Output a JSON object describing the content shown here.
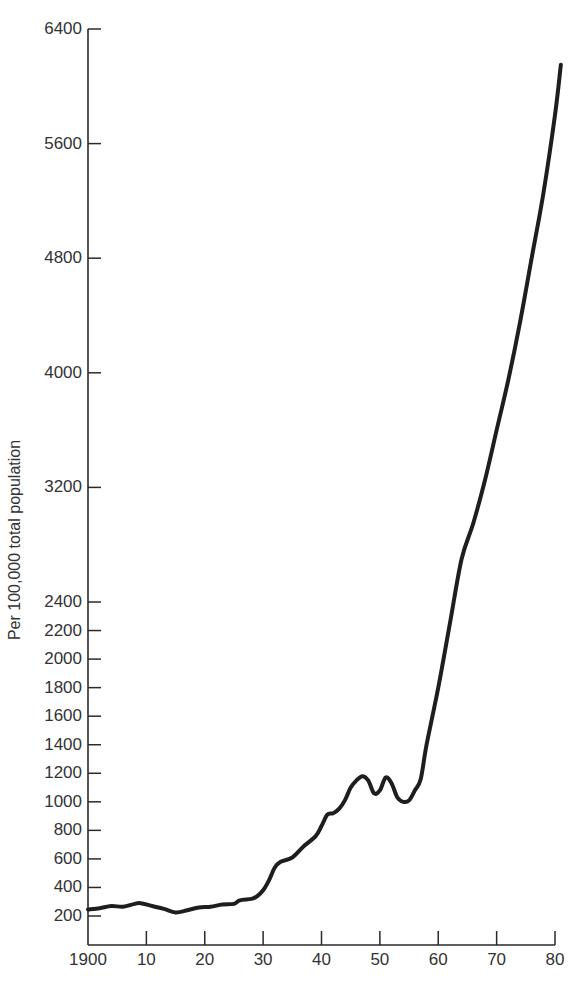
{
  "chart_data": {
    "type": "line",
    "title": "",
    "xlabel": "",
    "ylabel": "Per 100,000 total population",
    "x_ticks": [
      "1900",
      "10",
      "20",
      "30",
      "40",
      "50",
      "60",
      "70",
      "80"
    ],
    "y_ticks": [
      "200",
      "400",
      "600",
      "800",
      "1000",
      "1200",
      "1400",
      "1600",
      "1800",
      "2000",
      "2200",
      "2400",
      "3200",
      "4000",
      "4800",
      "5600",
      "6400"
    ],
    "y_scale_note": "broken scale: 200-step ticks from 200 to 2400, 800-step ticks from 2400 to 6400",
    "xlim": [
      1900,
      1980
    ],
    "ylim": [
      0,
      6400
    ],
    "grid": false,
    "legend": null,
    "series": [
      {
        "name": "Rate per 100,000 total population",
        "x": [
          1900,
          1902,
          1904,
          1906,
          1908,
          1909,
          1911,
          1913,
          1915,
          1917,
          1919,
          1921,
          1923,
          1925,
          1926,
          1928,
          1929,
          1930,
          1931,
          1932,
          1933,
          1935,
          1937,
          1939,
          1940,
          1941,
          1942,
          1943,
          1944,
          1945,
          1946,
          1947,
          1948,
          1949,
          1950,
          1951,
          1952,
          1953,
          1954,
          1955,
          1956,
          1957,
          1958,
          1960,
          1962,
          1964,
          1966,
          1968,
          1970,
          1972,
          1974,
          1976,
          1978,
          1980,
          1981
        ],
        "y": [
          245,
          255,
          270,
          265,
          285,
          290,
          270,
          250,
          225,
          240,
          260,
          265,
          280,
          285,
          310,
          320,
          340,
          380,
          450,
          540,
          580,
          610,
          690,
          760,
          830,
          910,
          920,
          950,
          1010,
          1100,
          1150,
          1180,
          1150,
          1060,
          1080,
          1170,
          1130,
          1030,
          1000,
          1010,
          1080,
          1160,
          1400,
          1800,
          2250,
          2700,
          2950,
          3250,
          3600,
          3950,
          4350,
          4800,
          5250,
          5800,
          6150
        ]
      }
    ]
  }
}
